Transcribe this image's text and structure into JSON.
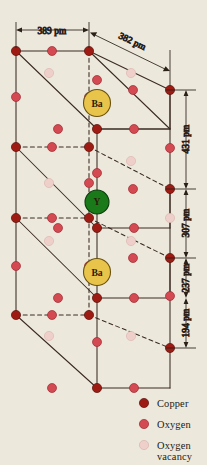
{
  "figure": {
    "background_color": "#ece8dc"
  },
  "colors": {
    "copper": "#9e1b14",
    "oxygen": "#d44a52",
    "oxygen_vacancy": "#efcfc9",
    "barium": "#e8c44a",
    "barium_stroke": "#8a6a10",
    "yttrium": "#1a7a1a",
    "yttrium_stroke": "#0d3d0d",
    "line": "#3a2a22",
    "atom_stroke": "#5a1008"
  },
  "dimensions": [
    {
      "id": "a-axis",
      "value": "389 pm",
      "orientation": "horizontal",
      "note": "top front edge width"
    },
    {
      "id": "depth-axis",
      "value": "382 pm",
      "orientation": "oblique",
      "note": "top depth edge"
    },
    {
      "id": "cu-ba-ba",
      "value": "431 pm",
      "orientation": "vertical",
      "note": "upper right interval"
    },
    {
      "id": "ba-y",
      "value": "307 pm",
      "orientation": "vertical",
      "note": "second right interval"
    },
    {
      "id": "y-cu",
      "value": "237 pm",
      "orientation": "vertical",
      "note": "third right interval"
    },
    {
      "id": "cu-o-bottom",
      "value": "194 pm",
      "orientation": "vertical",
      "note": "lowest right interval"
    }
  ],
  "site_labels": [
    {
      "id": "ba-top",
      "text": "Ba"
    },
    {
      "id": "yttrium",
      "text": "Y"
    },
    {
      "id": "ba-bottom",
      "text": "Ba"
    }
  ],
  "legend": {
    "items": [
      {
        "id": "copper",
        "label": "Copper",
        "color_key": "copper"
      },
      {
        "id": "oxygen",
        "label": "Oxygen",
        "color_key": "oxygen"
      },
      {
        "id": "oxygen-vacancy",
        "label": "Oxygen",
        "label2": "vacancy",
        "color_key": "oxygen_vacancy"
      }
    ]
  },
  "atoms": {
    "copper": [
      [
        16,
        51
      ],
      [
        89,
        51
      ],
      [
        16,
        147
      ],
      [
        89,
        147
      ],
      [
        16,
        218
      ],
      [
        89,
        218
      ],
      [
        16,
        315
      ],
      [
        89,
        315
      ],
      [
        170,
        90
      ],
      [
        170,
        189
      ],
      [
        170,
        258
      ],
      [
        170,
        348
      ],
      [
        97,
        129
      ],
      [
        97,
        228
      ],
      [
        97,
        298
      ],
      [
        97,
        388
      ]
    ],
    "oxygen": [
      [
        52,
        51
      ],
      [
        16,
        97
      ],
      [
        89,
        97
      ],
      [
        133,
        90
      ],
      [
        170,
        148
      ],
      [
        58,
        129
      ],
      [
        134,
        129
      ],
      [
        52,
        147
      ],
      [
        89,
        183
      ],
      [
        16,
        266
      ],
      [
        89,
        266
      ],
      [
        52,
        218
      ],
      [
        133,
        189
      ],
      [
        170,
        296
      ],
      [
        58,
        228
      ],
      [
        134,
        228
      ],
      [
        52,
        315
      ],
      [
        133,
        258
      ],
      [
        58,
        298
      ],
      [
        134,
        298
      ],
      [
        97,
        173
      ],
      [
        97,
        271
      ],
      [
        97,
        342
      ],
      [
        52,
        388
      ],
      [
        134,
        388
      ],
      [
        97,
        80
      ],
      [
        97,
        272
      ]
    ],
    "oxygen_vacancy": [
      [
        49,
        73
      ],
      [
        131,
        73
      ],
      [
        49,
        183
      ],
      [
        131,
        161
      ],
      [
        49,
        241
      ],
      [
        131,
        241
      ],
      [
        49,
        336
      ],
      [
        131,
        336
      ],
      [
        97,
        204
      ],
      [
        170,
        218
      ]
    ]
  }
}
